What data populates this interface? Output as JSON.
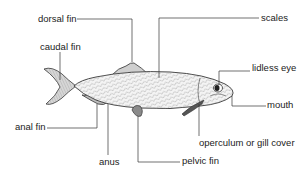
{
  "diagram": {
    "colors": {
      "line": "#333333",
      "text": "#222222",
      "body_fill": "#f4f4f4",
      "fin_fill": "#d6d6d6",
      "scale_hatch": "#9a9a9a"
    },
    "labels": {
      "dorsal_fin": "dorsal fin",
      "scales": "scales",
      "caudal_fin": "caudal fin",
      "lidless_eye": "lidless eye",
      "mouth": "mouth",
      "anal_fin": "anal fin",
      "anus": "anus",
      "operculum": "operculum or gill cover",
      "pelvic_fin": "pelvic fin"
    }
  }
}
